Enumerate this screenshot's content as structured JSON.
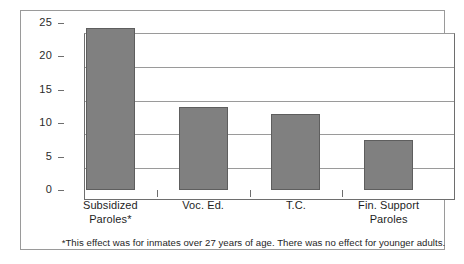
{
  "chart_data": {
    "type": "bar",
    "title": "",
    "subtitle": "",
    "xlabel": "",
    "ylabel": "",
    "categories": [
      "Subsidized Paroles*",
      "Voc. Ed.",
      "T.C.",
      "Fin. Support Paroles"
    ],
    "category_lines": [
      [
        "Subsidized",
        "Paroles*"
      ],
      [
        "Voc. Ed.",
        ""
      ],
      [
        "T.C.",
        ""
      ],
      [
        "Fin. Support",
        "Paroles"
      ]
    ],
    "values": [
      24.2,
      12.4,
      11.4,
      7.5
    ],
    "ylim": [
      0,
      25
    ],
    "yticks": [
      0,
      5,
      10,
      15,
      20,
      25
    ],
    "ytick_labels": [
      "0",
      "5",
      "10",
      "15",
      "20",
      "25"
    ],
    "grid": true,
    "legend": "none",
    "annotation": "*This effect was for inmates over 27 years of age. There was no effect for younger adults.",
    "colors": {
      "bar_fill": "#808080",
      "bar_edge": "#5e5e5e",
      "gridline": "#9a9a9a",
      "axis": "#6e6e6e",
      "frame": "#9a9a9a",
      "text": "#1e1e1e",
      "background": "#ffffff"
    }
  }
}
